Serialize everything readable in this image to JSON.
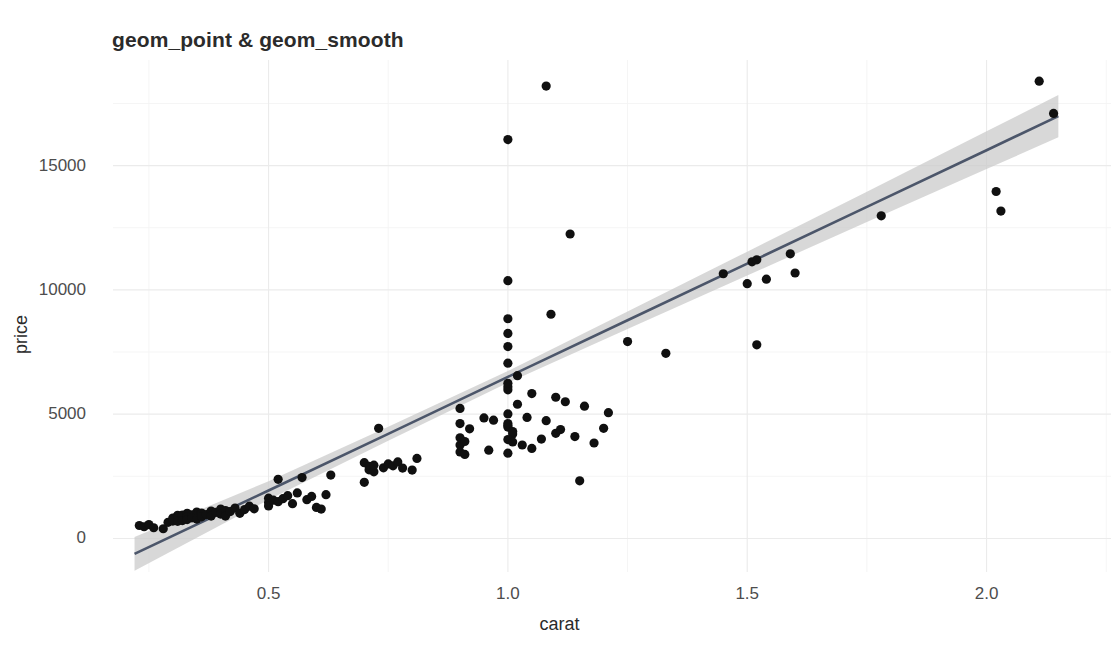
{
  "chart_data": {
    "type": "scatter",
    "title": "geom_point & geom_smooth",
    "xlabel": "carat",
    "ylabel": "price",
    "xlim": [
      0.175,
      2.26
    ],
    "ylim": [
      -1350,
      19250
    ],
    "grid": true,
    "legend": null,
    "x_ticks": [
      0.5,
      1.0,
      1.5,
      2.0
    ],
    "x_tick_labels": [
      "0.5",
      "1.0",
      "1.5",
      "2.0"
    ],
    "y_ticks": [
      0,
      5000,
      10000,
      15000
    ],
    "y_tick_labels": [
      "0",
      "5000",
      "10000",
      "15000"
    ],
    "y_minor_ticks": [
      2500,
      7500,
      12500,
      17500
    ],
    "x_minor_ticks": [
      0.25,
      0.75,
      1.25,
      1.75,
      2.25
    ],
    "point_color": "#101010",
    "line_color": "#4c566a",
    "ribbon_color": "#c9c9c9",
    "grid_major_color": "#ebebeb",
    "grid_minor_color": "#f4f4f4",
    "panel_background": "#ffffff",
    "series": [
      {
        "name": "diamonds sample",
        "marker": "circle",
        "points": [
          [
            0.23,
            520
          ],
          [
            0.24,
            470
          ],
          [
            0.25,
            560
          ],
          [
            0.26,
            430
          ],
          [
            0.28,
            390
          ],
          [
            0.29,
            650
          ],
          [
            0.3,
            700
          ],
          [
            0.3,
            820
          ],
          [
            0.3,
            760
          ],
          [
            0.31,
            880
          ],
          [
            0.31,
            930
          ],
          [
            0.31,
            690
          ],
          [
            0.32,
            860
          ],
          [
            0.32,
            940
          ],
          [
            0.32,
            720
          ],
          [
            0.33,
            1010
          ],
          [
            0.33,
            880
          ],
          [
            0.33,
            760
          ],
          [
            0.34,
            950
          ],
          [
            0.34,
            830
          ],
          [
            0.35,
            1060
          ],
          [
            0.35,
            900
          ],
          [
            0.35,
            780
          ],
          [
            0.36,
            1020
          ],
          [
            0.36,
            870
          ],
          [
            0.37,
            960
          ],
          [
            0.38,
            1100
          ],
          [
            0.38,
            900
          ],
          [
            0.39,
            1050
          ],
          [
            0.4,
            1180
          ],
          [
            0.4,
            980
          ],
          [
            0.41,
            1120
          ],
          [
            0.41,
            900
          ],
          [
            0.42,
            1080
          ],
          [
            0.43,
            1220
          ],
          [
            0.44,
            1010
          ],
          [
            0.45,
            1160
          ],
          [
            0.46,
            1300
          ],
          [
            0.47,
            1190
          ],
          [
            0.5,
            1450
          ],
          [
            0.5,
            1620
          ],
          [
            0.5,
            1310
          ],
          [
            0.51,
            1540
          ],
          [
            0.52,
            2380
          ],
          [
            0.52,
            1480
          ],
          [
            0.53,
            1600
          ],
          [
            0.54,
            1720
          ],
          [
            0.55,
            1400
          ],
          [
            0.56,
            1830
          ],
          [
            0.57,
            2450
          ],
          [
            0.58,
            1560
          ],
          [
            0.59,
            1690
          ],
          [
            0.6,
            1250
          ],
          [
            0.61,
            1180
          ],
          [
            0.62,
            1760
          ],
          [
            0.63,
            2550
          ],
          [
            0.7,
            2260
          ],
          [
            0.7,
            3050
          ],
          [
            0.71,
            2760
          ],
          [
            0.71,
            2900
          ],
          [
            0.72,
            2680
          ],
          [
            0.72,
            2950
          ],
          [
            0.73,
            4430
          ],
          [
            0.74,
            2840
          ],
          [
            0.75,
            3000
          ],
          [
            0.76,
            2920
          ],
          [
            0.77,
            3080
          ],
          [
            0.78,
            2830
          ],
          [
            0.8,
            2750
          ],
          [
            0.81,
            3220
          ],
          [
            0.9,
            3760
          ],
          [
            0.9,
            4050
          ],
          [
            0.9,
            3480
          ],
          [
            0.9,
            4620
          ],
          [
            0.9,
            5230
          ],
          [
            0.91,
            3900
          ],
          [
            0.91,
            3380
          ],
          [
            0.92,
            4410
          ],
          [
            0.95,
            4850
          ],
          [
            0.96,
            3550
          ],
          [
            0.97,
            4760
          ],
          [
            1.0,
            3430
          ],
          [
            1.0,
            3980
          ],
          [
            1.0,
            4480
          ],
          [
            1.0,
            4540
          ],
          [
            1.0,
            4620
          ],
          [
            1.0,
            5010
          ],
          [
            1.0,
            5980
          ],
          [
            1.0,
            6100
          ],
          [
            1.0,
            6240
          ],
          [
            1.0,
            7050
          ],
          [
            1.0,
            7720
          ],
          [
            1.0,
            8250
          ],
          [
            1.0,
            8840
          ],
          [
            1.0,
            10370
          ],
          [
            1.0,
            16050
          ],
          [
            1.01,
            4200
          ],
          [
            1.01,
            4300
          ],
          [
            1.01,
            3880
          ],
          [
            1.02,
            5400
          ],
          [
            1.02,
            6550
          ],
          [
            1.03,
            3760
          ],
          [
            1.04,
            4870
          ],
          [
            1.05,
            3620
          ],
          [
            1.05,
            5830
          ],
          [
            1.07,
            4000
          ],
          [
            1.08,
            4740
          ],
          [
            1.08,
            18200
          ],
          [
            1.09,
            9020
          ],
          [
            1.1,
            4230
          ],
          [
            1.1,
            5680
          ],
          [
            1.11,
            4380
          ],
          [
            1.12,
            5500
          ],
          [
            1.13,
            12250
          ],
          [
            1.14,
            4100
          ],
          [
            1.15,
            2320
          ],
          [
            1.16,
            5320
          ],
          [
            1.18,
            3840
          ],
          [
            1.2,
            4430
          ],
          [
            1.21,
            5060
          ],
          [
            1.25,
            7920
          ],
          [
            1.33,
            7450
          ],
          [
            1.45,
            10650
          ],
          [
            1.5,
            10250
          ],
          [
            1.51,
            11130
          ],
          [
            1.52,
            7790
          ],
          [
            1.52,
            11210
          ],
          [
            1.54,
            10430
          ],
          [
            1.59,
            11450
          ],
          [
            1.6,
            10680
          ],
          [
            1.78,
            12980
          ],
          [
            2.02,
            13960
          ],
          [
            2.03,
            13170
          ],
          [
            2.11,
            18400
          ],
          [
            2.14,
            17100
          ]
        ]
      }
    ],
    "smooth": {
      "method": "lm",
      "line": [
        [
          0.22,
          -620
        ],
        [
          0.5,
          1930
        ],
        [
          0.75,
          4210
        ],
        [
          1.0,
          6500
        ],
        [
          1.25,
          8780
        ],
        [
          1.5,
          11060
        ],
        [
          1.75,
          13340
        ],
        [
          2.0,
          15620
        ],
        [
          2.15,
          16990
        ]
      ],
      "ci_upper": [
        [
          0.22,
          60
        ],
        [
          0.5,
          2300
        ],
        [
          0.75,
          4490
        ],
        [
          1.0,
          6740
        ],
        [
          1.25,
          9130
        ],
        [
          1.5,
          11540
        ],
        [
          1.75,
          13950
        ],
        [
          2.0,
          16380
        ],
        [
          2.15,
          17840
        ]
      ],
      "ci_lower": [
        [
          0.22,
          -1300
        ],
        [
          0.5,
          1560
        ],
        [
          0.75,
          3930
        ],
        [
          1.0,
          6260
        ],
        [
          1.25,
          8430
        ],
        [
          1.5,
          10580
        ],
        [
          1.75,
          12730
        ],
        [
          2.0,
          14860
        ],
        [
          2.15,
          16140
        ]
      ]
    }
  }
}
